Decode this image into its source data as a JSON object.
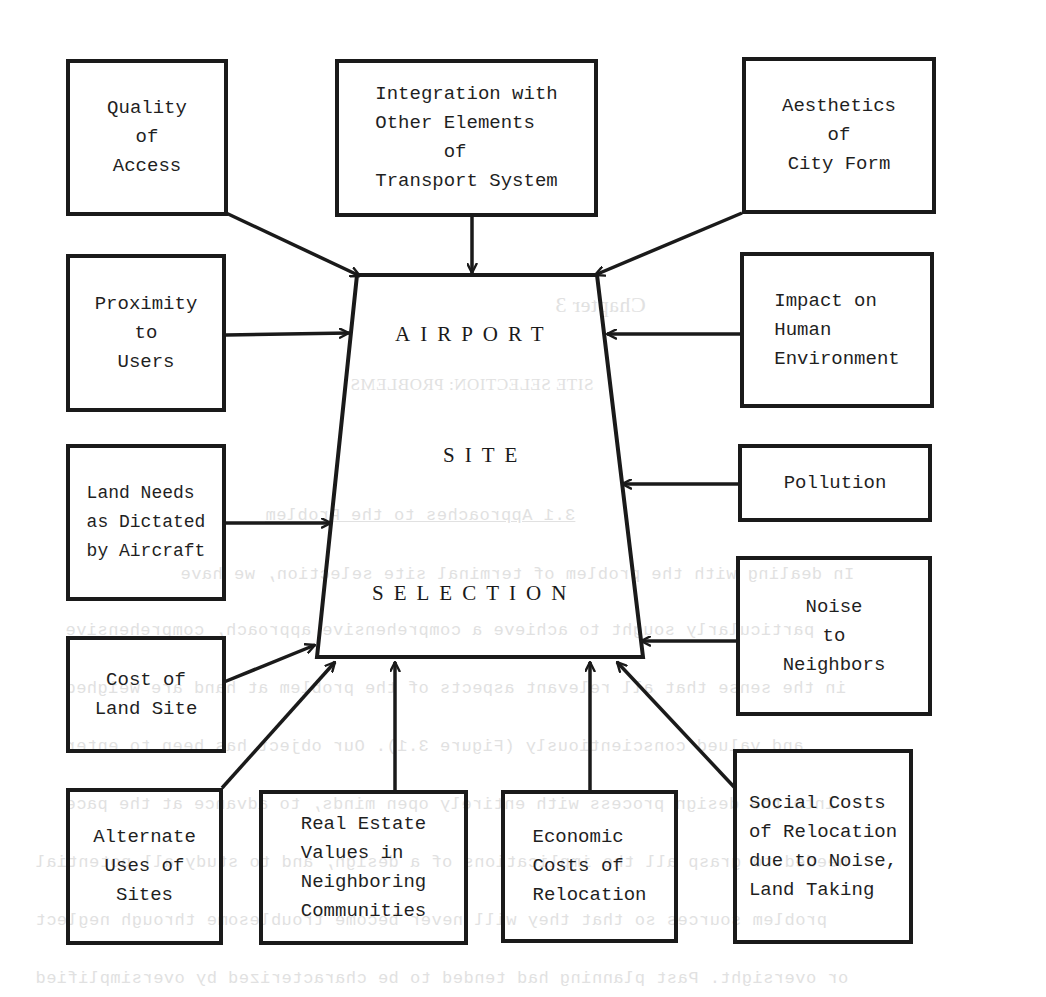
{
  "diagram": {
    "type": "influence-diagram",
    "center": {
      "shape": "trapezoid",
      "lines": [
        "AIRPORT",
        "SITE",
        "SELECTION"
      ]
    },
    "factors": [
      {
        "id": "quality-of-access",
        "label": "Quality\nof\nAccess",
        "position": "top-left"
      },
      {
        "id": "integration-transport",
        "label": "Integration with\nOther Elements\n      of\nTransport System",
        "position": "top-center"
      },
      {
        "id": "aesthetics-city-form",
        "label": "Aesthetics\nof\nCity Form",
        "position": "top-right"
      },
      {
        "id": "proximity-to-users",
        "label": "Proximity\nto\nUsers",
        "position": "left"
      },
      {
        "id": "impact-human-environment",
        "label": "Impact on\nHuman\nEnvironment",
        "position": "right"
      },
      {
        "id": "land-needs-aircraft",
        "label": "Land Needs\nas Dictated\nby Aircraft",
        "position": "left"
      },
      {
        "id": "pollution",
        "label": "Pollution",
        "position": "right"
      },
      {
        "id": "noise-to-neighbors",
        "label": "Noise\nto\nNeighbors",
        "position": "right"
      },
      {
        "id": "cost-of-land-site",
        "label": "Cost of\nLand Site",
        "position": "bottom-left"
      },
      {
        "id": "alternate-uses-of-sites",
        "label": "Alternate\nUses of\nSites",
        "position": "bottom-left"
      },
      {
        "id": "real-estate-values",
        "label": "Real Estate\nValues in\nNeighboring\nCommunities",
        "position": "bottom"
      },
      {
        "id": "economic-costs-relocation",
        "label": "Economic\nCosts of\nRelocation",
        "position": "bottom"
      },
      {
        "id": "social-costs-relocation",
        "label": "Social Costs\nof Relocation\ndue to Noise,\nLand Taking",
        "position": "bottom-right"
      }
    ],
    "edges_direction": "all factors point into center"
  },
  "bleed_through": {
    "chapter": "Chapter 3",
    "title": "SITE SELECTION:  PROBLEMS",
    "section": "3.1     Approaches to the Problem",
    "lines": [
      "In dealing with the problem of terminal site selection, we have",
      "particularly sought to achieve a comprehensive approach, comprehensive",
      "in the sense that all relevant aspects of the problem at hand are weighed",
      "and valued conscientiously (Figure 3.1).  Our object has been to enter",
      "into the design process with entirely open minds, to advance at the pace",
      "needed to grasp all the implications of a design, and to study all potential",
      "problem sources so that they will never become troublesome through neglect",
      "or oversight.  Past planning had tended to be characterized by oversimplified"
    ]
  },
  "colors": {
    "ink": "#1a1a1a",
    "paper": "#ffffff",
    "bleed": "#c9c9c9"
  }
}
